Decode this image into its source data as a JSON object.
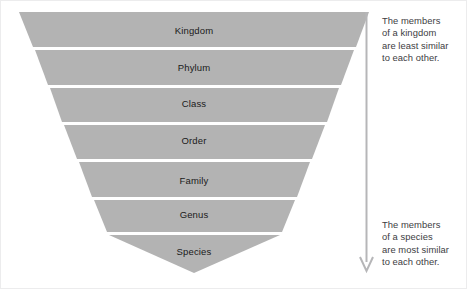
{
  "diagram": {
    "band_color": "#b3b3b3",
    "background_color": "#ffffff",
    "text_color": "#1a1a1a",
    "note_color": "#3d3d3f",
    "arrow_color": "#b6b6b8",
    "levels": [
      {
        "label": "Kingdom",
        "rank": 1,
        "cx": 193,
        "cy": 29
      },
      {
        "label": "Phylum",
        "rank": 2,
        "cx": 193,
        "cy": 66
      },
      {
        "label": "Class",
        "rank": 3,
        "cx": 193,
        "cy": 102
      },
      {
        "label": "Order",
        "rank": 4,
        "cx": 193,
        "cy": 139
      },
      {
        "label": "Family",
        "rank": 5,
        "cx": 193,
        "cy": 179
      },
      {
        "label": "Genus",
        "rank": 6,
        "cx": 193,
        "cy": 213
      },
      {
        "label": "Species",
        "rank": 7,
        "cx": 193,
        "cy": 250
      }
    ],
    "notes": {
      "top": "The members\nof a kingdom\nare least similar\nto each other.",
      "bottom": "The members\nof a species\nare most similar\nto each other."
    },
    "arrow": {
      "direction": "down",
      "meaning": "increasing similarity"
    }
  }
}
